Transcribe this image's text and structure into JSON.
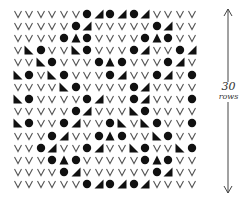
{
  "legend_symbols": {
    "v": "knit-v",
    "o": "filled-dot",
    "r": "triangle-right-edge",
    "l": "triangle-left-edge",
    "a": "triangle-up"
  },
  "colors": {
    "ink": "#111111",
    "v_stroke": "#555555",
    "arrow": "#444444",
    "background": "#ffffff"
  },
  "grid": {
    "columns": 16,
    "rows": [
      "vvvvvvorororvvvv",
      "vvvvvorvvvvvorvv",
      "vvvvoaovvvvoaovv",
      "vlovvlovvvorvvor",
      "vvlovvvoaovvvorv",
      "lovlovvvorvvorvo",
      "vvvvlovvvvorvvvv",
      "lovvvvorvvorvvvo",
      "vvvvvorvvvlovvvv",
      "lovvorvvolvlovvo",
      "vvvorvvoaovvlovv",
      "vvorvvorvvlovvlo",
      "vvvoaovvvvvoaovv",
      "vvvvorvvvvvvorvv",
      "vvvvvvorororvvvv"
    ]
  },
  "annotation": {
    "number": "30",
    "unit": "rows",
    "arrow": "double-headed-vertical-arrow"
  }
}
